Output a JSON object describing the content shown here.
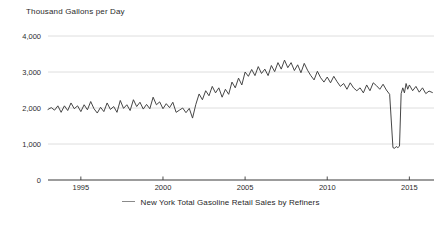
{
  "chart_data": {
    "type": "line",
    "title": "",
    "ylabel": "Thousand Gallons per Day",
    "xlabel": "",
    "ylim": [
      0,
      4000
    ],
    "xlim": [
      1993.0,
      2016.5
    ],
    "grid": true,
    "legend_position": "bottom-center",
    "ytick_labels": [
      "0",
      "1,000",
      "2,000",
      "3,000",
      "4,000"
    ],
    "ytick_values": [
      0,
      1000,
      2000,
      3000,
      4000
    ],
    "xtick_labels": [
      "1995",
      "2000",
      "2005",
      "2010",
      "2015"
    ],
    "xtick_values": [
      1995,
      2000,
      2005,
      2010,
      2015
    ],
    "series": [
      {
        "name": "New York Total Gasoline Retail Sales by Refiners",
        "color": "#3c3c3c",
        "x": [
          1993.0,
          1993.2,
          1993.4,
          1993.6,
          1993.8,
          1994.0,
          1994.2,
          1994.4,
          1994.6,
          1994.8,
          1995.0,
          1995.2,
          1995.4,
          1995.6,
          1995.8,
          1996.0,
          1996.2,
          1996.4,
          1996.6,
          1996.8,
          1997.0,
          1997.2,
          1997.4,
          1997.6,
          1997.8,
          1998.0,
          1998.2,
          1998.4,
          1998.6,
          1998.8,
          1999.0,
          1999.2,
          1999.4,
          1999.6,
          1999.8,
          2000.0,
          2000.2,
          2000.4,
          2000.6,
          2000.8,
          2001.0,
          2001.2,
          2001.4,
          2001.6,
          2001.8,
          2002.0,
          2002.2,
          2002.4,
          2002.6,
          2002.8,
          2003.0,
          2003.2,
          2003.4,
          2003.6,
          2003.8,
          2004.0,
          2004.2,
          2004.4,
          2004.6,
          2004.8,
          2005.0,
          2005.2,
          2005.4,
          2005.6,
          2005.8,
          2006.0,
          2006.2,
          2006.4,
          2006.6,
          2006.8,
          2007.0,
          2007.2,
          2007.4,
          2007.6,
          2007.8,
          2008.0,
          2008.2,
          2008.4,
          2008.6,
          2008.8,
          2009.0,
          2009.2,
          2009.4,
          2009.6,
          2009.8,
          2010.0,
          2010.2,
          2010.4,
          2010.6,
          2010.8,
          2011.0,
          2011.2,
          2011.4,
          2011.6,
          2011.8,
          2012.0,
          2012.2,
          2012.4,
          2012.6,
          2012.8,
          2013.0,
          2013.2,
          2013.4,
          2013.6,
          2013.8,
          2014.0,
          2014.1,
          2014.2,
          2014.3,
          2014.4,
          2014.5,
          2014.6,
          2014.7,
          2014.8,
          2014.9,
          2015.0,
          2015.2,
          2015.4,
          2015.6,
          2015.8,
          2016.0,
          2016.2,
          2016.4
        ],
        "values": [
          1960,
          2010,
          1940,
          2060,
          1880,
          2060,
          1930,
          2140,
          1980,
          2060,
          1900,
          2090,
          1950,
          2180,
          1980,
          1860,
          2020,
          1900,
          2140,
          1960,
          2040,
          1880,
          2210,
          1990,
          2090,
          1930,
          2230,
          2040,
          2160,
          1970,
          2100,
          1980,
          2300,
          2090,
          2170,
          1980,
          2120,
          2010,
          2160,
          1880,
          1940,
          2000,
          1870,
          1990,
          1720,
          2100,
          2390,
          2230,
          2480,
          2340,
          2600,
          2420,
          2560,
          2300,
          2520,
          2380,
          2720,
          2560,
          2830,
          2640,
          3000,
          2880,
          3070,
          2900,
          3150,
          2960,
          3080,
          2900,
          3180,
          3010,
          3260,
          3080,
          3330,
          3120,
          3260,
          3040,
          3200,
          2980,
          3240,
          3050,
          2900,
          2780,
          3020,
          2840,
          2720,
          2860,
          2700,
          2880,
          2730,
          2600,
          2680,
          2520,
          2700,
          2560,
          2480,
          2560,
          2420,
          2640,
          2480,
          2700,
          2620,
          2520,
          2660,
          2500,
          2380,
          900,
          880,
          930,
          900,
          940,
          2400,
          2560,
          2420,
          2680,
          2520,
          2640,
          2480,
          2600,
          2440,
          2560,
          2400,
          2470,
          2430
        ]
      }
    ]
  },
  "legend": {
    "entries": [
      {
        "label": "New York Total Gasoline Retail Sales by Refiners",
        "color": "#8a8a8a"
      }
    ]
  }
}
